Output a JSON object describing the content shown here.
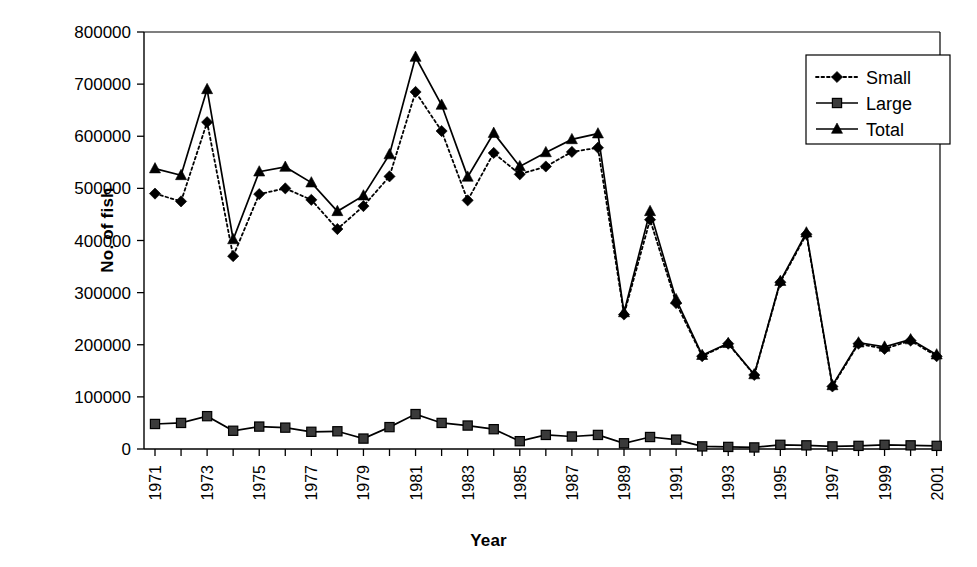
{
  "chart_data": {
    "type": "line",
    "title": "",
    "xlabel": "Year",
    "ylabel": "No. of fish",
    "ylim": [
      0,
      800000
    ],
    "ytick_labels": [
      "0",
      "100000",
      "200000",
      "300000",
      "400000",
      "500000",
      "600000",
      "700000",
      "800000"
    ],
    "ytick_values": [
      0,
      100000,
      200000,
      300000,
      400000,
      500000,
      600000,
      700000,
      800000
    ],
    "grid": false,
    "legend_position": "top-right",
    "legend_entries": [
      "Small",
      "Large",
      "Total"
    ],
    "x": [
      1971,
      1972,
      1973,
      1974,
      1975,
      1976,
      1977,
      1978,
      1979,
      1980,
      1981,
      1982,
      1983,
      1984,
      1985,
      1986,
      1987,
      1988,
      1989,
      1990,
      1991,
      1992,
      1993,
      1994,
      1995,
      1996,
      1997,
      1998,
      1999,
      2000,
      2001
    ],
    "xtick_labels": [
      "1971",
      "",
      "1973",
      "",
      "1975",
      "",
      "1977",
      "",
      "1979",
      "",
      "1981",
      "",
      "1983",
      "",
      "1985",
      "",
      "1987",
      "",
      "1989",
      "",
      "1991",
      "",
      "1993",
      "",
      "1995",
      "",
      "1997",
      "",
      "1999",
      "",
      "2001"
    ],
    "xtick_labels_shown": [
      "1971",
      "1973",
      "1975",
      "1977",
      "1979",
      "1981",
      "1983",
      "1985",
      "1987",
      "1989",
      "1991",
      "1993",
      "1995",
      "1997",
      "1999",
      "2001"
    ],
    "series": [
      {
        "name": "Small",
        "marker": "diamond",
        "linestyle": "dotted",
        "color": "#000000",
        "values": [
          490000,
          475000,
          627000,
          370000,
          489000,
          500000,
          478000,
          422000,
          466000,
          523000,
          685000,
          610000,
          477000,
          568000,
          527000,
          542000,
          570000,
          578000,
          258000,
          440000,
          280000,
          178000,
          202000,
          142000,
          320000,
          412000,
          120000,
          202000,
          192000,
          208000,
          178000
        ]
      },
      {
        "name": "Large",
        "marker": "square",
        "linestyle": "solid",
        "color": "#000000",
        "values": [
          48000,
          50000,
          63000,
          35000,
          43000,
          41000,
          33000,
          34000,
          20000,
          42000,
          67000,
          50000,
          45000,
          38000,
          15000,
          27000,
          24000,
          27000,
          11000,
          23000,
          18000,
          5000,
          4000,
          3000,
          8000,
          7000,
          5000,
          6000,
          8000,
          7000,
          6000
        ]
      },
      {
        "name": "Total",
        "marker": "triangle",
        "linestyle": "solid",
        "color": "#000000",
        "values": [
          538000,
          525000,
          690000,
          402000,
          532000,
          541000,
          511000,
          456000,
          486000,
          565000,
          752000,
          660000,
          522000,
          606000,
          542000,
          569000,
          594000,
          605000,
          262000,
          456000,
          287000,
          180000,
          203000,
          143000,
          322000,
          415000,
          122000,
          204000,
          196000,
          210000,
          181000
        ]
      }
    ]
  }
}
